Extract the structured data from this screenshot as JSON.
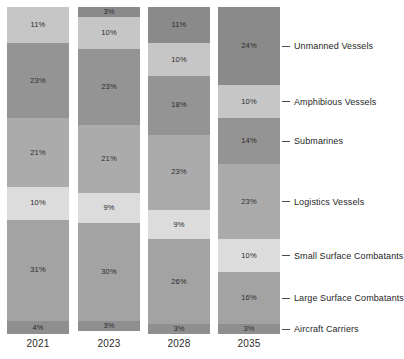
{
  "chart_data": {
    "type": "bar",
    "title": "",
    "subtitle": "",
    "xlabel": "",
    "ylabel": "",
    "stacked": true,
    "normalized_percent": true,
    "grid": false,
    "legend_position": "right-leader-lines",
    "ylim": [
      0,
      100
    ],
    "categories": [
      "2021",
      "2023",
      "2028",
      "2035"
    ],
    "series": [
      {
        "name": "Unmanned Vessels",
        "color": "#8a8a8a",
        "values": [
          0,
          3,
          11,
          24
        ]
      },
      {
        "name": "Amphibious Vessels",
        "color": "#c6c6c6",
        "values": [
          11,
          10,
          10,
          10
        ]
      },
      {
        "name": "Submarines",
        "color": "#949494",
        "values": [
          23,
          23,
          18,
          14
        ]
      },
      {
        "name": "Logistics Vessels",
        "color": "#ababab",
        "values": [
          21,
          21,
          23,
          23
        ]
      },
      {
        "name": "Small Surface Combatants",
        "color": "#dcdcdc",
        "values": [
          10,
          9,
          9,
          10
        ]
      },
      {
        "name": "Large Surface Combatants",
        "color": "#a3a3a3",
        "values": [
          31,
          30,
          26,
          16
        ]
      },
      {
        "name": "Aircraft Carriers",
        "color": "#8f8f8f",
        "values": [
          4,
          3,
          3,
          3
        ]
      }
    ],
    "value_suffix": "%",
    "bar_labels": {
      "2021": [
        "",
        "11%",
        "23%",
        "21%",
        "10%",
        "31%",
        "4%"
      ],
      "2023": [
        "3%",
        "10%",
        "23%",
        "21%",
        "9%",
        "30%",
        "3%"
      ],
      "2028": [
        "11%",
        "10%",
        "18%",
        "23%",
        "9%",
        "26%",
        "3%"
      ],
      "2035": [
        "24%",
        "10%",
        "14%",
        "23%",
        "10%",
        "16%",
        "3%"
      ]
    }
  },
  "axis": {
    "tick_labels": [
      "2021",
      "2023",
      "2028",
      "2035"
    ]
  },
  "legend": {
    "items": [
      {
        "label": "Unmanned Vessels"
      },
      {
        "label": "Amphibious Vessels"
      },
      {
        "label": "Submarines"
      },
      {
        "label": "Logistics Vessels"
      },
      {
        "label": "Small Surface Combatants"
      },
      {
        "label": "Large Surface Combatants"
      },
      {
        "label": "Aircraft Carriers"
      }
    ]
  }
}
